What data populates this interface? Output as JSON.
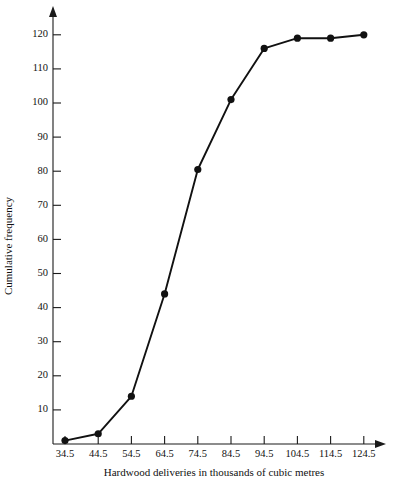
{
  "chart_data": {
    "type": "line",
    "title": "",
    "subtitle": "",
    "xlabel": "Hardwood deliveries in thousands of cubic metres",
    "ylabel": "Cumulative frequency",
    "x": [
      34.5,
      44.5,
      54.5,
      64.5,
      74.5,
      84.5,
      94.5,
      104.5,
      114.5,
      124.5
    ],
    "values": [
      1,
      3,
      14,
      44,
      80.5,
      101,
      116,
      119,
      119,
      120
    ],
    "series": [
      {
        "name": "Cumulative frequency",
        "values": [
          1,
          3,
          14,
          44,
          80.5,
          101,
          116,
          119,
          119,
          120
        ]
      }
    ],
    "xlim": [
      34.5,
      124.5
    ],
    "ylim": [
      0,
      126
    ],
    "xticks": [
      34.5,
      44.5,
      54.5,
      64.5,
      74.5,
      84.5,
      94.5,
      104.5,
      114.5,
      124.5
    ],
    "yticks": [
      10,
      20,
      30,
      40,
      50,
      60,
      70,
      80,
      90,
      100,
      110,
      120
    ],
    "xtick_labels": [
      "34.5",
      "44.5",
      "54.5",
      "64.5",
      "74.5",
      "84.5",
      "94.5",
      "104.5",
      "114.5",
      "124.5"
    ],
    "ytick_labels": [
      "10",
      "20",
      "30",
      "40",
      "50",
      "60",
      "70",
      "80",
      "90",
      "100",
      "110",
      "120"
    ],
    "grid": false,
    "legend": false,
    "legend_position": "none",
    "marker": "filled-circle",
    "line_color": "#111111",
    "marker_color": "#111111",
    "axis_color": "#1a1a1a",
    "background_color": "#ffffff",
    "axis_arrows": true,
    "annotations": []
  }
}
